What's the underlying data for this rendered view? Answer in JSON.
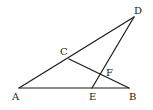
{
  "diagram": {
    "type": "geometry",
    "points": {
      "A": {
        "x": 19,
        "y": 88,
        "label": "A",
        "lx": 12,
        "ly": 100
      },
      "B": {
        "x": 129,
        "y": 88,
        "label": "B",
        "lx": 129,
        "ly": 100
      },
      "C": {
        "x": 69,
        "y": 59,
        "label": "C",
        "lx": 60,
        "ly": 55
      },
      "D": {
        "x": 134,
        "y": 17,
        "label": "D",
        "lx": 134,
        "ly": 14
      },
      "E": {
        "x": 92,
        "y": 88,
        "label": "E",
        "lx": 89,
        "ly": 100
      },
      "F": {
        "x": 101,
        "y": 75,
        "label": "F",
        "lx": 106,
        "ly": 76
      }
    },
    "segments": [
      {
        "from": "A",
        "to": "D"
      },
      {
        "from": "A",
        "to": "B"
      },
      {
        "from": "C",
        "to": "B"
      },
      {
        "from": "D",
        "to": "E"
      }
    ]
  }
}
